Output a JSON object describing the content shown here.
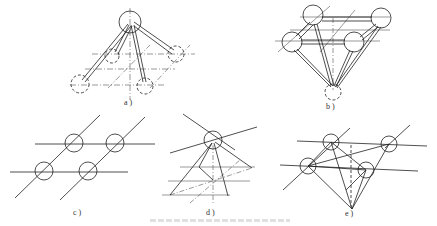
{
  "figure": {
    "panels": [
      {
        "id": "a",
        "label": "a )",
        "description": "Tripod of tubes from a top circle to dashed base circles over dash-dot grid"
      },
      {
        "id": "b",
        "label": "b )",
        "description": "Four circles at top connected by tubes converging to a single bottom point"
      },
      {
        "id": "c",
        "label": "c )",
        "description": "Four circles at intersections of two horizontal and two diagonal lines"
      },
      {
        "id": "d",
        "label": "d )",
        "description": "Single circle with lines radiating down to a pyramid base on dash-dot grid"
      },
      {
        "id": "e",
        "label": "e )",
        "description": "Four circles on two horizontal lines connected by lines converging to a bottom point"
      }
    ],
    "caption": ""
  },
  "colors": {
    "line": "#222222",
    "background": "#ffffff"
  }
}
